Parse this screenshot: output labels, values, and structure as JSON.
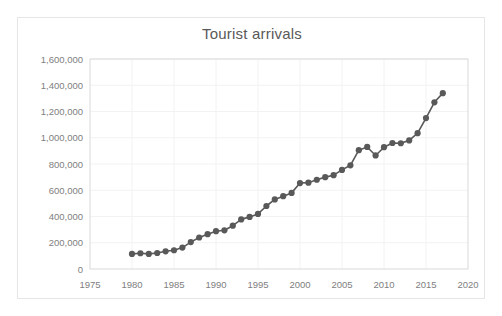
{
  "chart": {
    "title": "Tourist arrivals",
    "accent_color": "#595959",
    "gridline_color": "#f2f2f2",
    "border_color": "#d9d9d9",
    "tick_color": "#808080"
  },
  "chart_data": {
    "type": "line",
    "title": "Tourist arrivals",
    "xlabel": "",
    "ylabel": "",
    "xlim": [
      1975,
      2020
    ],
    "ylim": [
      0,
      1600000
    ],
    "xticks": [
      1975,
      1980,
      1985,
      1990,
      1995,
      2000,
      2005,
      2010,
      2015,
      2020
    ],
    "xtick_labels": [
      "1975",
      "1980",
      "1985",
      "1990",
      "1995",
      "2000",
      "2005",
      "2010",
      "2015",
      "2020"
    ],
    "yticks": [
      0,
      200000,
      400000,
      600000,
      800000,
      1000000,
      1200000,
      1400000,
      1600000
    ],
    "ytick_labels": [
      "0",
      "200,000",
      "400,000",
      "600,000",
      "800,000",
      "1,000,000",
      "1,200,000",
      "1,400,000",
      "1,600,000"
    ],
    "grid": true,
    "legend": false,
    "markers": true,
    "x": [
      1980,
      1981,
      1982,
      1983,
      1984,
      1985,
      1986,
      1987,
      1988,
      1989,
      1990,
      1991,
      1992,
      1993,
      1994,
      1995,
      1996,
      1997,
      1998,
      1999,
      2000,
      2001,
      2002,
      2003,
      2004,
      2005,
      2006,
      2007,
      2008,
      2009,
      2010,
      2011,
      2012,
      2013,
      2014,
      2015,
      2016,
      2017
    ],
    "series": [
      {
        "name": "Tourist arrivals",
        "color": "#595959",
        "values": [
          115000,
          120000,
          115000,
          122000,
          135000,
          143000,
          163000,
          205000,
          240000,
          265000,
          288000,
          295000,
          330000,
          378000,
          397000,
          420000,
          480000,
          530000,
          555000,
          580000,
          655000,
          658000,
          680000,
          700000,
          715000,
          755000,
          790000,
          905000,
          930000,
          865000,
          928000,
          960000,
          958000,
          980000,
          1035000,
          1150000,
          1270000,
          1340000
        ]
      }
    ]
  }
}
